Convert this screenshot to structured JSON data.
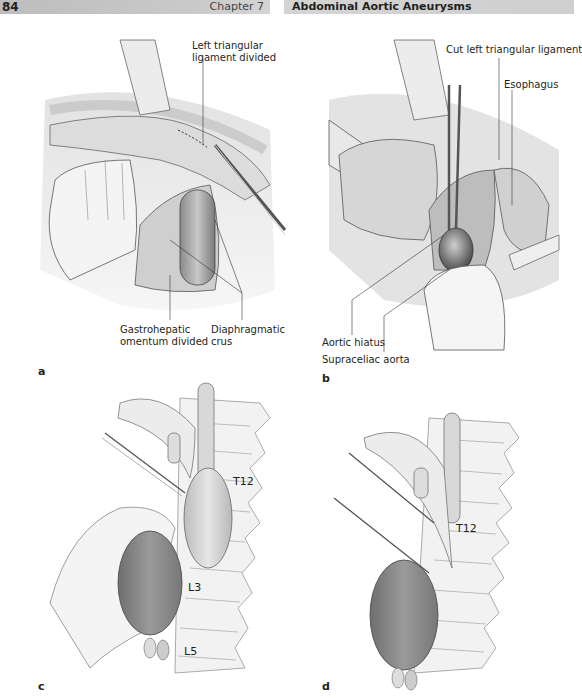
{
  "header": {
    "page_number": "84",
    "chapter": "Chapter 7",
    "running_title": "Abdominal Aortic Aneurysms",
    "colors": {
      "left_bar": "#c4c4c4",
      "right_bar": "#d1d1d1",
      "text": "#231f20"
    }
  },
  "figure": {
    "panels": [
      {
        "id": "a",
        "label": "a",
        "annotations": [
          {
            "line1": "Left triangular",
            "line2": "ligament divided"
          },
          {
            "line1": "Gastrohepatic",
            "line2": "omentum divided"
          },
          {
            "line1": "Diaphragmatic",
            "line2": "crus"
          }
        ]
      },
      {
        "id": "b",
        "label": "b",
        "annotations": [
          {
            "text": "Cut left triangular ligament"
          },
          {
            "text": "Esophagus"
          },
          {
            "text": "Aortic hiatus"
          },
          {
            "text": "Supraceliac aorta"
          }
        ]
      },
      {
        "id": "c",
        "label": "c",
        "vertebra_labels": [
          "T12",
          "L3",
          "L5"
        ]
      },
      {
        "id": "d",
        "label": "d",
        "vertebra_labels": [
          "T12"
        ]
      }
    ]
  }
}
